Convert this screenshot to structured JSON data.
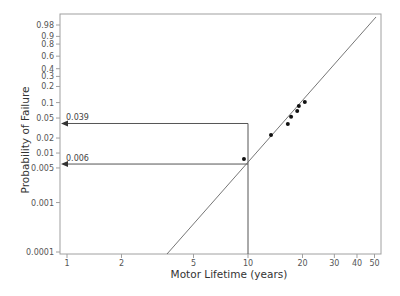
{
  "chart_data": {
    "type": "scatter",
    "title": "",
    "xlabel": "Motor Lifetime (years)",
    "ylabel": "Probability of Failure",
    "x_scale": "log",
    "y_scale": "weibull-probability",
    "xlim": [
      0.92,
      56
    ],
    "ylim": [
      0.0001,
      0.995
    ],
    "grid": false,
    "legend": null,
    "x_ticks": [
      1,
      2,
      5,
      10,
      20,
      30,
      40,
      50
    ],
    "x_tick_labels": [
      "1",
      "2",
      "5",
      "10",
      "20",
      "30",
      "40",
      "50"
    ],
    "y_ticks": [
      0.0001,
      0.001,
      0.005,
      0.01,
      0.02,
      0.05,
      0.1,
      0.2,
      0.3,
      0.4,
      0.6,
      0.8,
      0.9,
      0.98
    ],
    "y_tick_labels": [
      "0.0001",
      "0.001",
      "0.005",
      "0.01",
      "0.02",
      "0.05",
      "0.1",
      "0.2",
      "0.3",
      "0.4",
      "0.6",
      "0.8",
      "0.9",
      "0.98"
    ],
    "series": [
      {
        "name": "Failures",
        "kind": "points",
        "x": [
          9.5,
          13.4,
          16.6,
          17.3,
          18.7,
          19.1,
          20.6
        ],
        "y": [
          0.0076,
          0.023,
          0.038,
          0.053,
          0.069,
          0.086,
          0.103
        ]
      },
      {
        "name": "Weibull fit",
        "kind": "line",
        "x": [
          3.3,
          50
        ],
        "y": [
          0.0001,
          0.98
        ]
      }
    ],
    "annotations": [
      {
        "label": "0.039",
        "probability": 0.039,
        "box_to_x": 10,
        "arrow_to": "y-axis"
      },
      {
        "label": "0.006",
        "probability": 0.006,
        "from_x": 10,
        "arrow_to": "y-axis"
      }
    ],
    "reference_lines": [
      {
        "orientation": "vertical",
        "x": 10
      }
    ]
  },
  "colors": {
    "axis": "#a0a0a0",
    "tick_text": "#555555",
    "fit_line": "#666666",
    "points": "#111111",
    "annotation": "#555555"
  }
}
